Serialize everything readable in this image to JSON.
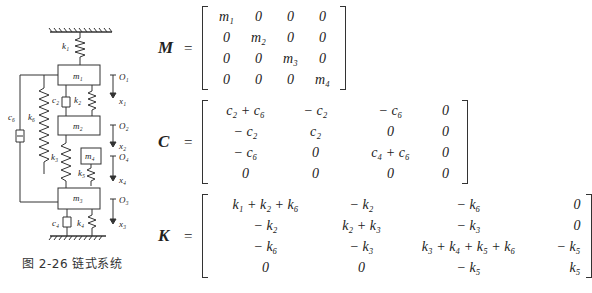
{
  "figure": {
    "caption": "图 2-26   链式系统",
    "labels": {
      "k1": "k₁",
      "k2": "k₂",
      "k3": "k₃",
      "k4": "k₄",
      "k5": "k₅",
      "k6": "k₆",
      "c2": "c₂",
      "c4": "c₄",
      "c6": "c₆",
      "m1": "m₁",
      "m2": "m₂",
      "m3": "m₃",
      "m4": "m₄",
      "O1": "O₁",
      "O2": "O₂",
      "O3": "O₃",
      "O4": "O₄",
      "x1": "x₁",
      "x2": "x₂",
      "x3": "x₃",
      "x4": "x₄"
    }
  },
  "equations": {
    "M": {
      "symbol": "M",
      "equals": "=",
      "rows": [
        [
          "m₁",
          "0",
          "0",
          "0"
        ],
        [
          "0",
          "m₂",
          "0",
          "0"
        ],
        [
          "0",
          "0",
          "m₃",
          "0"
        ],
        [
          "0",
          "0",
          "0",
          "m₄"
        ]
      ]
    },
    "C": {
      "symbol": "C",
      "equals": "=",
      "rows": [
        [
          "c₂ + c₆",
          "− c₂",
          "− c₆",
          "0"
        ],
        [
          "− c₂",
          "c₂",
          "0",
          "0"
        ],
        [
          "− c₆",
          "0",
          "c₄ + c₆",
          "0"
        ],
        [
          "0",
          "0",
          "0",
          "0"
        ]
      ]
    },
    "K": {
      "symbol": "K",
      "equals": "=",
      "rows": [
        [
          "k₁ + k₂ + k₆",
          "− k₂",
          "− k₆",
          "0"
        ],
        [
          "− k₂",
          "k₂ + k₃",
          "− k₃",
          "0"
        ],
        [
          "− k₆",
          "− k₃",
          "k₃ + k₄ + k₅ + k₆",
          "− k₅"
        ],
        [
          "0",
          "0",
          "− k₅",
          "k₅"
        ]
      ]
    }
  }
}
